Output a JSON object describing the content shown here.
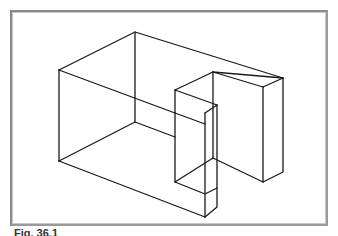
{
  "figure": {
    "caption": "Fig. 36.1",
    "line_color": "#1a1a1a",
    "frame_color": "#8a8a8a"
  }
}
